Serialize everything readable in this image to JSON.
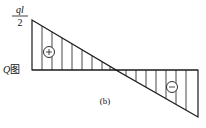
{
  "diagram": {
    "type": "shear-force-diagram",
    "title_label": "Q图",
    "title_label_var": "Q",
    "title_label_suffix": "图",
    "subfigure_label": "(b)",
    "top_value": {
      "numerator": "ql",
      "denominator": "2"
    },
    "regions": [
      {
        "sign": "+",
        "position": "above-baseline",
        "side": "left"
      },
      {
        "sign": "−",
        "position": "below-baseline",
        "side": "right"
      }
    ],
    "colors": {
      "line": "#1a1a1a",
      "background": "#ffffff"
    }
  }
}
